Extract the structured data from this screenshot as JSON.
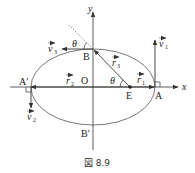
{
  "figure": {
    "caption": "図 8.9",
    "axes": {
      "x_label": "x",
      "y_label": "y",
      "origin_label": "O"
    },
    "points": {
      "A": "A",
      "A_prime": "A′",
      "B": "B",
      "B_prime": "B′",
      "E": "E"
    },
    "vectors": {
      "v1": "v",
      "v1_sub": "1",
      "v2": "v",
      "v2_sub": "2",
      "v3": "v",
      "v3_sub": "3",
      "r1": "r",
      "r1_sub": "1",
      "r2": "r",
      "r2_sub": "2",
      "r3": "r",
      "r3_sub": "3"
    },
    "angles": {
      "theta_top": "θ",
      "theta_E": "θ"
    },
    "colors": {
      "line": "#333333",
      "background": "#ffffff"
    }
  }
}
